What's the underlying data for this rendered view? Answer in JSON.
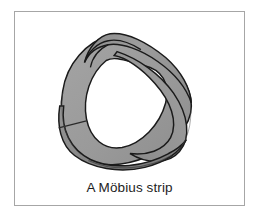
{
  "figure": {
    "caption": "A Möbius strip",
    "frame": {
      "border_color": "#a6a6a6",
      "background_color": "#ffffff"
    },
    "illustration": {
      "name": "mobius-strip",
      "description": "A shaded grey band forming a loop with a half twist, drawn in perspective with a white hole in the middle",
      "band_fill_color": "#9a9a9a",
      "band_shade_color": "#868686",
      "band_highlight_color": "#ababab",
      "outline_color": "#1a1a1a",
      "hole_color": "#ffffff",
      "seam_line_color": "#2a2a2a"
    }
  },
  "page": {
    "background_color": "#ffffff"
  }
}
